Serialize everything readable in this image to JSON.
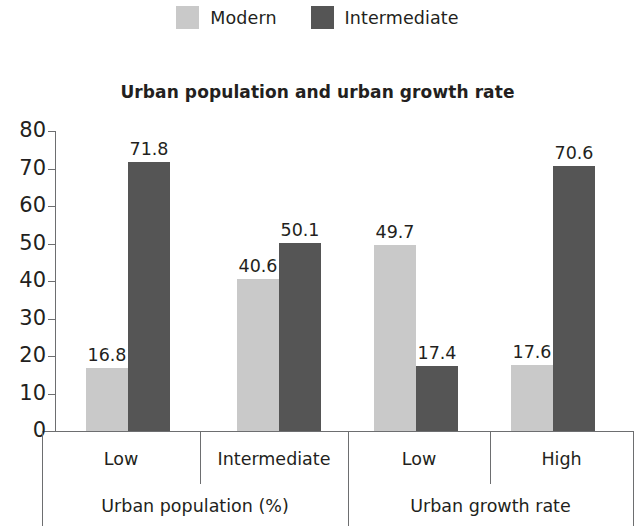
{
  "legend": {
    "entries": [
      {
        "label": "Modern",
        "color": "#c9c9c9",
        "swatch_name": "legend-swatch-modern"
      },
      {
        "label": "Intermediate",
        "color": "#555555",
        "swatch_name": "legend-swatch-intermediate"
      }
    ]
  },
  "title": "Urban population and urban growth rate",
  "axis": {
    "y_ticks": [
      "0",
      "10",
      "20",
      "30",
      "40",
      "50",
      "60",
      "70",
      "80"
    ],
    "categories": [
      "Low",
      "Intermediate",
      "Low",
      "High"
    ],
    "groups": [
      "Urban population (%)",
      "Urban growth rate"
    ]
  },
  "values_text": {
    "modern": [
      "16.8",
      "40.6",
      "49.7",
      "17.6"
    ],
    "intermediate": [
      "71.8",
      "50.1",
      "17.4",
      "70.6"
    ]
  },
  "colors": {
    "modern": "#c9c9c9",
    "intermediate": "#555555",
    "axis": "#6d6e70",
    "text": "#231f20",
    "background": "#ffffff"
  },
  "chart_data": {
    "type": "bar",
    "title": "Urban population and urban growth rate",
    "xlabel": "",
    "ylabel": "",
    "ylim": [
      0,
      80
    ],
    "ytick_step": 10,
    "grid": false,
    "legend_position": "top-center",
    "categories": [
      "Low",
      "Intermediate",
      "Low",
      "High"
    ],
    "category_groups": [
      {
        "label": "Urban population (%)",
        "categories": [
          "Low",
          "Intermediate"
        ]
      },
      {
        "label": "Urban growth rate",
        "categories": [
          "Low",
          "High"
        ]
      }
    ],
    "series": [
      {
        "name": "Modern",
        "color": "#c9c9c9",
        "values": [
          16.8,
          40.6,
          49.7,
          17.6
        ]
      },
      {
        "name": "Intermediate",
        "color": "#555555",
        "values": [
          71.8,
          50.1,
          17.4,
          70.6
        ]
      }
    ],
    "data_labels": true
  }
}
